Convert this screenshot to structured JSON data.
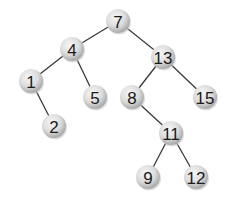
{
  "diagram": {
    "type": "binary-search-tree",
    "node_style": {
      "fill_light": "#f4f4f4",
      "fill_dark": "#b9b9b9",
      "edge_color": "#3a3a3a",
      "radius": 12
    },
    "nodes": [
      {
        "id": "n7",
        "label": "7",
        "x": 118,
        "y": 21
      },
      {
        "id": "n4",
        "label": "4",
        "x": 72,
        "y": 49
      },
      {
        "id": "n13",
        "label": "13",
        "x": 163,
        "y": 57
      },
      {
        "id": "n1",
        "label": "1",
        "x": 31,
        "y": 81
      },
      {
        "id": "n5",
        "label": "5",
        "x": 95,
        "y": 97
      },
      {
        "id": "n8",
        "label": "8",
        "x": 132,
        "y": 97
      },
      {
        "id": "n15",
        "label": "15",
        "x": 205,
        "y": 97
      },
      {
        "id": "n2",
        "label": "2",
        "x": 54,
        "y": 126
      },
      {
        "id": "n11",
        "label": "11",
        "x": 171,
        "y": 133
      },
      {
        "id": "n9",
        "label": "9",
        "x": 148,
        "y": 177
      },
      {
        "id": "n12",
        "label": "12",
        "x": 196,
        "y": 177
      }
    ],
    "edges": [
      [
        "n7",
        "n4"
      ],
      [
        "n7",
        "n13"
      ],
      [
        "n4",
        "n1"
      ],
      [
        "n4",
        "n5"
      ],
      [
        "n13",
        "n8"
      ],
      [
        "n13",
        "n15"
      ],
      [
        "n1",
        "n2"
      ],
      [
        "n8",
        "n11"
      ],
      [
        "n11",
        "n9"
      ],
      [
        "n11",
        "n12"
      ]
    ]
  }
}
